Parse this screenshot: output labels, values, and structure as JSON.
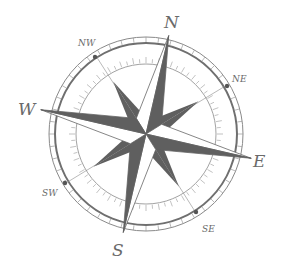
{
  "figure": {
    "type": "compass-rose",
    "center": [
      146,
      134
    ],
    "rotation_deg": 13,
    "colors": {
      "dark": "#5f5f5f",
      "light": "#ffffff",
      "ring": "#8a8a8a",
      "label": "#6a6a6a",
      "background": "#ffffff"
    }
  },
  "labels": {
    "n": "N",
    "e": "E",
    "s": "S",
    "w": "W",
    "ne": "NE",
    "se": "SE",
    "sw": "SW",
    "nw": "NW"
  }
}
